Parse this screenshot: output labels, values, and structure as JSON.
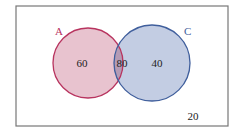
{
  "diagram": {
    "type": "venn",
    "universe": {
      "outside_value": "20"
    },
    "sets": [
      {
        "id": "A",
        "label": "A",
        "only_value": "60",
        "stroke": "#b8345f",
        "fill": "#e8c3cf"
      },
      {
        "id": "C",
        "label": "C",
        "only_value": "40",
        "stroke": "#3f5e9c",
        "fill": "#c3cde3"
      }
    ],
    "intersection": {
      "sets": [
        "A",
        "C"
      ],
      "value": "80",
      "fill": "#b59bb5"
    }
  }
}
